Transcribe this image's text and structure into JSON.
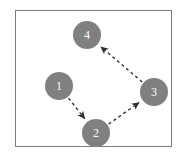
{
  "figure": {
    "type": "node-link-diagram",
    "background_color": "#ffffff",
    "frame": {
      "border_color": "#7d7d7d",
      "fill_color": "#ffffff"
    },
    "node_style": {
      "fill_color": "#808080",
      "label_color": "#ffffff",
      "diameter_px": 28
    },
    "edge_style": {
      "color": "#333333",
      "dash": "3 3",
      "arrowhead": "solid-triangle"
    }
  },
  "nodes": [
    {
      "id": "1",
      "label": "1",
      "cx": 59,
      "cy": 86
    },
    {
      "id": "2",
      "label": "2",
      "cx": 96,
      "cy": 133
    },
    {
      "id": "3",
      "label": "3",
      "cx": 154,
      "cy": 92
    },
    {
      "id": "4",
      "label": "4",
      "cx": 87,
      "cy": 35
    }
  ],
  "edges": [
    {
      "from": "1",
      "to": "2",
      "directed": true,
      "style": "dashed"
    },
    {
      "from": "2",
      "to": "3",
      "directed": true,
      "style": "dashed"
    },
    {
      "from": "3",
      "to": "4",
      "directed": true,
      "style": "dashed"
    }
  ]
}
